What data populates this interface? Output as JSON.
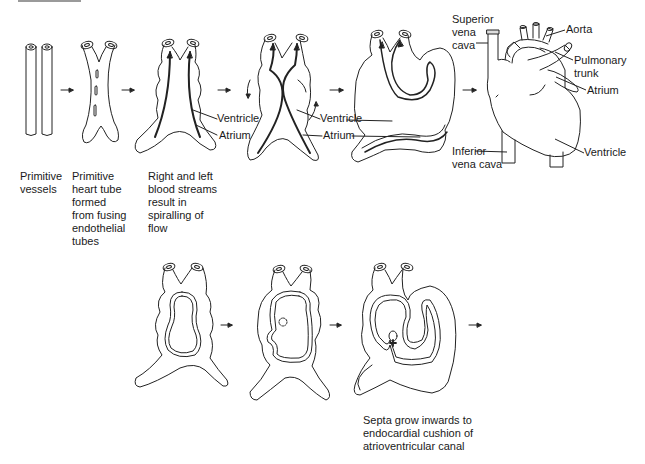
{
  "figure": {
    "top_row": {
      "stages": [
        {
          "id": "primitive-vessels",
          "caption": [
            "Primitive",
            "vessels"
          ]
        },
        {
          "id": "primitive-heart-tube",
          "caption": [
            "Primitive",
            "heart tube",
            "formed",
            "from fusing",
            "endothelial",
            "tubes"
          ]
        },
        {
          "id": "spiralling-flow",
          "caption": [
            "Right and left",
            "blood streams",
            "result in",
            "spiralling of",
            "flow"
          ],
          "labels": [
            "Ventricle",
            "Atrium"
          ]
        },
        {
          "id": "twisting-tube",
          "labels": [
            "Ventricle",
            "Atrium"
          ]
        },
        {
          "id": "looped-heart",
          "labels": []
        },
        {
          "id": "mature-heart",
          "labels": [
            "Superior vena cava",
            "Aorta",
            "Pulmonary trunk",
            "Atrium",
            "Inferior vena cava",
            "Ventricle"
          ]
        }
      ]
    },
    "bottom_row": {
      "stages": [
        {
          "id": "chamber-forming"
        },
        {
          "id": "septum-beginning"
        },
        {
          "id": "septa-growth",
          "caption": [
            "Septa grow inwards to",
            "endocardial cushion of",
            "atrioventricular canal"
          ]
        }
      ]
    },
    "labels": {
      "sup_vc_1": "Superior",
      "sup_vc_2": "vena",
      "sup_vc_3": "cava",
      "aorta": "Aorta",
      "pulm_1": "Pulmonary",
      "pulm_2": "trunk",
      "atrium": "Atrium",
      "inf_vc_1": "Inferior",
      "inf_vc_2": "vena cava",
      "ventricle": "Ventricle"
    },
    "arrow_glyph": "→",
    "line_color": "#222222"
  }
}
